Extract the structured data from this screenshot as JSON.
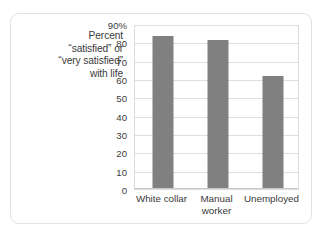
{
  "chart_data": {
    "type": "bar",
    "title": "",
    "subtitle": "",
    "xlabel": "",
    "ylabel": "Percent “satisfied” or “very satisfied” with life",
    "ylabel_lines": [
      "Percent",
      "“satisfied” or",
      "“very satisfied”",
      "with life"
    ],
    "categories": [
      "White collar",
      "Manual worker",
      "Unemployed"
    ],
    "category_label_lines": [
      [
        "White collar"
      ],
      [
        "Manual",
        "worker"
      ],
      [
        "Unemployed"
      ]
    ],
    "values": [
      83,
      81,
      61
    ],
    "ylim": [
      0,
      90
    ],
    "ytick_values": [
      0,
      10,
      20,
      30,
      40,
      50,
      60,
      70,
      80,
      90
    ],
    "ytick_labels": [
      "0",
      "10",
      "20",
      "30",
      "40",
      "50",
      "60",
      "70",
      "80",
      "90%"
    ],
    "grid": true,
    "legend": false,
    "legend_position": "none",
    "bar_color": "#808080",
    "gridline_color": "#dddddd",
    "plot_border_color": "#dcdcdc",
    "text_color": "#3a3a3a",
    "card_border_color": "#e2e2e2",
    "background_color": "#ffffff"
  }
}
